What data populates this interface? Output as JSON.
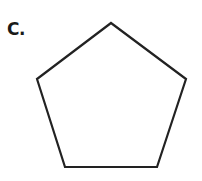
{
  "figure": {
    "label": "C.",
    "shape": "pentagon",
    "vertices": [
      [
        111,
        23
      ],
      [
        186,
        79
      ],
      [
        157,
        167
      ],
      [
        65,
        167
      ],
      [
        37,
        79
      ]
    ],
    "stroke_color": "#222222",
    "stroke_width": 2.2,
    "fill_color": "#ffffff"
  }
}
